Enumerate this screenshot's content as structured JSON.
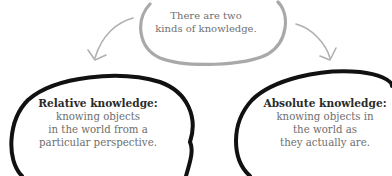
{
  "diagram": {
    "top_node": {
      "line1": "There are two",
      "line2": "kinds of knowledge."
    },
    "left_node": {
      "title": "Relative knowledge:",
      "line1": "knowing objects",
      "line2": "in the world from a",
      "line3": "particular perspective."
    },
    "right_node": {
      "title": "Absolute knowledge:",
      "line1": "knowing objects in",
      "line2": "the world as",
      "line3": "they actually are."
    },
    "colors": {
      "top_outline": "#a9a9a9",
      "arrow": "#a9a9a9",
      "node_outline": "#111111",
      "body_text": "#6e6e6e",
      "title_text": "#2a2a2a"
    }
  }
}
